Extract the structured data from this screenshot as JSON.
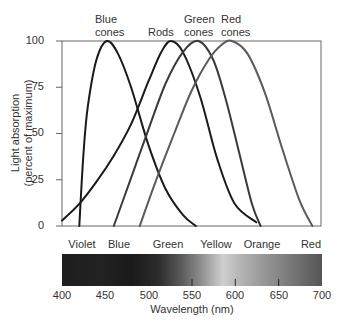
{
  "chart_data": {
    "type": "line",
    "title": "",
    "xlabel": "Wavelength (nm)",
    "ylabel": "Light absorption (percent of maximum)",
    "ylabel_lines": [
      "Light absorption",
      "(percent of maximum)"
    ],
    "xlim": [
      400,
      700
    ],
    "ylim": [
      0,
      100
    ],
    "xticks": [
      400,
      450,
      500,
      550,
      600,
      650,
      700
    ],
    "yticks": [
      0,
      25,
      50,
      75,
      100
    ],
    "grid": false,
    "legend": "inline labels above peaks",
    "series": [
      {
        "name": "Blue cones",
        "label_lines": [
          "Blue",
          "cones"
        ],
        "color": "#1a1a1a",
        "peak_nm": 452,
        "x": [
          420,
          425,
          430,
          440,
          452,
          465,
          480,
          500,
          520,
          540,
          555
        ],
        "y": [
          0,
          40,
          65,
          90,
          100,
          93,
          75,
          44,
          20,
          6,
          0
        ]
      },
      {
        "name": "Rods",
        "label_lines": [
          "Rods"
        ],
        "color": "#1a1a1a",
        "peak_nm": 526,
        "x": [
          400,
          420,
          440,
          460,
          480,
          500,
          515,
          526,
          540,
          560,
          580,
          600,
          625
        ],
        "y": [
          3,
          12,
          24,
          38,
          55,
          78,
          94,
          100,
          94,
          70,
          36,
          12,
          2
        ]
      },
      {
        "name": "Green cones",
        "label_lines": [
          "Green",
          "cones"
        ],
        "color": "#3a3a3a",
        "peak_nm": 558,
        "x": [
          460,
          480,
          500,
          520,
          540,
          558,
          575,
          590,
          605,
          620,
          630
        ],
        "y": [
          0,
          26,
          52,
          77,
          94,
          100,
          90,
          68,
          40,
          12,
          0
        ]
      },
      {
        "name": "Red cones",
        "label_lines": [
          "Red",
          "cones"
        ],
        "color": "#5a5a5a",
        "peak_nm": 597,
        "x": [
          490,
          510,
          530,
          550,
          570,
          585,
          597,
          615,
          635,
          655,
          675,
          690
        ],
        "y": [
          0,
          26,
          50,
          73,
          90,
          98,
          100,
          93,
          72,
          42,
          14,
          0
        ]
      }
    ],
    "spectrum_bands": [
      {
        "name": "Violet",
        "x_nm": 418
      },
      {
        "name": "Blue",
        "x_nm": 456
      },
      {
        "name": "Green",
        "x_nm": 508
      },
      {
        "name": "Yellow",
        "x_nm": 563
      },
      {
        "name": "Orange",
        "x_nm": 613
      },
      {
        "name": "Red",
        "x_nm": 664
      }
    ]
  },
  "labels": {
    "blue_cones_1": "Blue",
    "blue_cones_2": "cones",
    "rods": "Rods",
    "green_cones_1": "Green",
    "green_cones_2": "cones",
    "red_cones_1": "Red",
    "red_cones_2": "cones",
    "ylabel_1": "Light absorption",
    "ylabel_2": "(percent of maximum)",
    "xlabel": "Wavelength (nm)",
    "yticks": [
      "100",
      "75",
      "50",
      "25",
      "0"
    ],
    "xticks": [
      "400",
      "450",
      "500",
      "550",
      "600",
      "650",
      "700"
    ],
    "bands": [
      "Violet",
      "Blue",
      "Green",
      "Yellow",
      "Orange",
      "Red"
    ]
  }
}
